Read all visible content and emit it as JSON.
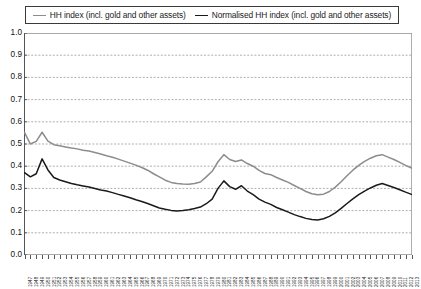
{
  "legend": {
    "position": "top",
    "entries": [
      {
        "label": "HH index (incl. gold and other assets)",
        "color": "#8c8c8c"
      },
      {
        "label": "Normalised HH index (incl. gold and other assets)",
        "color": "#1a1a1a"
      }
    ]
  },
  "axes": {
    "y_ticks": [
      "1.0",
      "0.9",
      "0.8",
      "0.7",
      "0.6",
      "0.5",
      "0.4",
      "0.3",
      "0.2",
      "0.1",
      "0.0"
    ]
  },
  "chart_data": {
    "type": "line",
    "title": "",
    "xlabel": "",
    "ylabel": "",
    "ylim": [
      0.0,
      1.0
    ],
    "xlim": [
      1947,
      2013
    ],
    "grid": true,
    "legend_position": "top",
    "x": [
      1947,
      1948,
      1949,
      1950,
      1951,
      1952,
      1953,
      1954,
      1955,
      1956,
      1957,
      1958,
      1959,
      1960,
      1961,
      1962,
      1963,
      1964,
      1965,
      1966,
      1967,
      1968,
      1969,
      1970,
      1971,
      1972,
      1973,
      1974,
      1975,
      1976,
      1977,
      1978,
      1979,
      1980,
      1981,
      1982,
      1983,
      1984,
      1985,
      1986,
      1987,
      1988,
      1989,
      1990,
      1991,
      1992,
      1993,
      1994,
      1995,
      1996,
      1997,
      1998,
      1999,
      2000,
      2001,
      2002,
      2003,
      2004,
      2005,
      2006,
      2007,
      2008,
      2009,
      2010,
      2011,
      2012,
      2013
    ],
    "series": [
      {
        "name": "HH index (incl. gold and other assets)",
        "color": "#8c8c8c",
        "values": [
          0.552,
          0.5,
          0.512,
          0.553,
          0.513,
          0.497,
          0.492,
          0.487,
          0.482,
          0.478,
          0.472,
          0.468,
          0.462,
          0.455,
          0.447,
          0.44,
          0.432,
          0.423,
          0.414,
          0.405,
          0.394,
          0.382,
          0.366,
          0.352,
          0.337,
          0.327,
          0.322,
          0.32,
          0.319,
          0.322,
          0.329,
          0.352,
          0.377,
          0.42,
          0.452,
          0.43,
          0.421,
          0.428,
          0.412,
          0.4,
          0.381,
          0.367,
          0.362,
          0.349,
          0.338,
          0.327,
          0.313,
          0.3,
          0.286,
          0.276,
          0.271,
          0.274,
          0.286,
          0.306,
          0.33,
          0.357,
          0.382,
          0.404,
          0.422,
          0.436,
          0.447,
          0.452,
          0.441,
          0.43,
          0.417,
          0.404,
          0.392
        ]
      },
      {
        "name": "Normalised HH index (incl. gold and other assets)",
        "color": "#1a1a1a",
        "values": [
          0.371,
          0.352,
          0.366,
          0.433,
          0.383,
          0.349,
          0.338,
          0.33,
          0.322,
          0.316,
          0.311,
          0.306,
          0.3,
          0.293,
          0.288,
          0.281,
          0.273,
          0.266,
          0.258,
          0.249,
          0.241,
          0.232,
          0.222,
          0.212,
          0.206,
          0.201,
          0.198,
          0.2,
          0.204,
          0.209,
          0.216,
          0.231,
          0.252,
          0.3,
          0.334,
          0.308,
          0.296,
          0.312,
          0.288,
          0.272,
          0.252,
          0.238,
          0.228,
          0.214,
          0.204,
          0.193,
          0.182,
          0.173,
          0.165,
          0.16,
          0.158,
          0.163,
          0.174,
          0.19,
          0.21,
          0.232,
          0.253,
          0.272,
          0.288,
          0.302,
          0.314,
          0.322,
          0.313,
          0.304,
          0.294,
          0.283,
          0.273
        ]
      }
    ]
  }
}
